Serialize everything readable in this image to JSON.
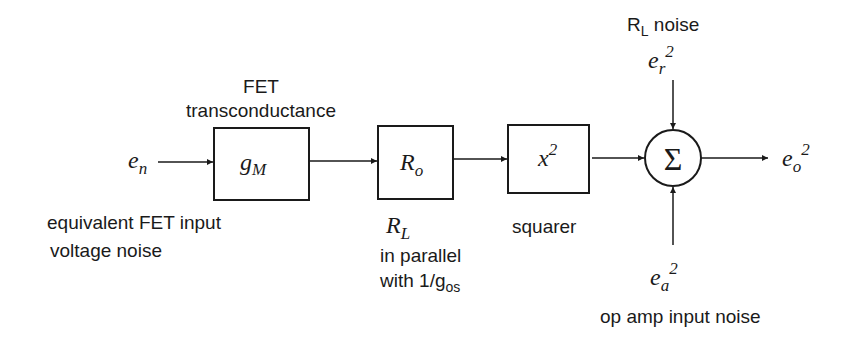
{
  "diagram": {
    "input": {
      "symbol": "e",
      "subscript": "n",
      "label_line1": "equivalent FET input",
      "label_line2": "voltage noise"
    },
    "blocks": [
      {
        "id": "gm",
        "symbol": "g",
        "subscript": "M",
        "label_line1": "FET",
        "label_line2": "transconductance"
      },
      {
        "id": "ro",
        "symbol": "R",
        "subscript": "o",
        "label_symbol": "R",
        "label_subscript": "L",
        "label_line1": "in parallel",
        "label_line2": "with 1/g",
        "label_line2_sub": "os"
      },
      {
        "id": "squarer",
        "symbol": "x",
        "superscript": "2",
        "label": "squarer"
      }
    ],
    "summer": {
      "symbol": "Σ"
    },
    "top_input": {
      "label": "R",
      "label_sub": "L",
      "label_rest": " noise",
      "symbol": "e",
      "subscript": "r",
      "superscript": "2"
    },
    "bottom_input": {
      "symbol": "e",
      "subscript": "a",
      "superscript": "2",
      "label": "op amp input noise"
    },
    "output": {
      "symbol": "e",
      "subscript": "o",
      "superscript": "2"
    },
    "colors": {
      "line": "#1a1a1a",
      "background": "#ffffff"
    }
  }
}
